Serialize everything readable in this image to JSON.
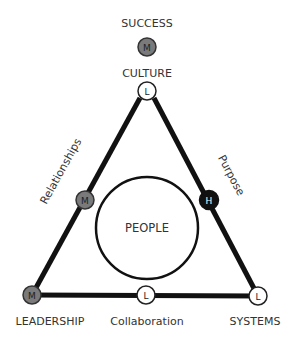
{
  "diagram": {
    "center_label": "PEOPLE",
    "nodes": {
      "success": {
        "label": "SUCCESS",
        "level": "M"
      },
      "culture": {
        "label": "CULTURE",
        "level": "L"
      },
      "relationships": {
        "label": "Relationships",
        "level": "M"
      },
      "purpose": {
        "label": "Purpose",
        "level": "H"
      },
      "leadership": {
        "label": "LEADERSHIP",
        "level": "M"
      },
      "collaboration": {
        "label": "Collaboration",
        "level": "L"
      },
      "systems": {
        "label": "SYSTEMS",
        "level": "L"
      }
    },
    "legend_colors": {
      "L": "#ffffff",
      "M": "#7a7a7a",
      "H": "#111111"
    }
  }
}
